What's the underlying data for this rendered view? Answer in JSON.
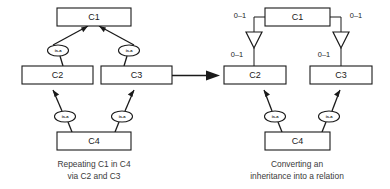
{
  "figure": {
    "kind": "er-inheritance-transformation-diagram",
    "background_color": "#ffffff",
    "line_color": "#1a1a1a",
    "text_color": "#1a1a1a",
    "caption_color": "#3a3a3a"
  },
  "left_panel": {
    "caption_line1": "Repeating C1 in C4",
    "caption_line2": "via C2 and C3",
    "entities": [
      {
        "id": "c1",
        "label": "C1"
      },
      {
        "id": "c2",
        "label": "C2"
      },
      {
        "id": "c3",
        "label": "C3"
      },
      {
        "id": "c4",
        "label": "C4"
      }
    ],
    "relationships": [
      {
        "id": "c2-c1",
        "label": "is-a",
        "from": "C2",
        "to": "C1"
      },
      {
        "id": "c3-c1",
        "label": "is-a",
        "from": "C3",
        "to": "C1"
      },
      {
        "id": "c4-c2",
        "label": "is-a",
        "from": "C4",
        "to": "C2"
      },
      {
        "id": "c4-c3",
        "label": "is-a",
        "from": "C4",
        "to": "C3"
      }
    ]
  },
  "right_panel": {
    "caption_line1": "Converting an",
    "caption_line2": "inheritance into a relation",
    "entities": [
      {
        "id": "c1",
        "label": "C1"
      },
      {
        "id": "c2",
        "label": "C2"
      },
      {
        "id": "c3",
        "label": "C3"
      },
      {
        "id": "c4",
        "label": "C4"
      }
    ],
    "relationships": [
      {
        "id": "c4-c2",
        "label": "is-a",
        "from": "C4",
        "to": "C2"
      },
      {
        "id": "c4-c3",
        "label": "is-a",
        "from": "C4",
        "to": "C3"
      }
    ],
    "cardinalities": [
      {
        "id": "c1-left",
        "label": "0–1"
      },
      {
        "id": "c1-right",
        "label": "0–1"
      },
      {
        "id": "c2-top",
        "label": "0–1"
      },
      {
        "id": "c3-top",
        "label": "0–1"
      }
    ],
    "markers": [
      {
        "id": "tri-left",
        "shape": "hollow-triangle"
      },
      {
        "id": "tri-right",
        "shape": "hollow-triangle"
      }
    ]
  },
  "transform_arrow": {
    "id": "transformation-arrow",
    "direction": "right"
  }
}
